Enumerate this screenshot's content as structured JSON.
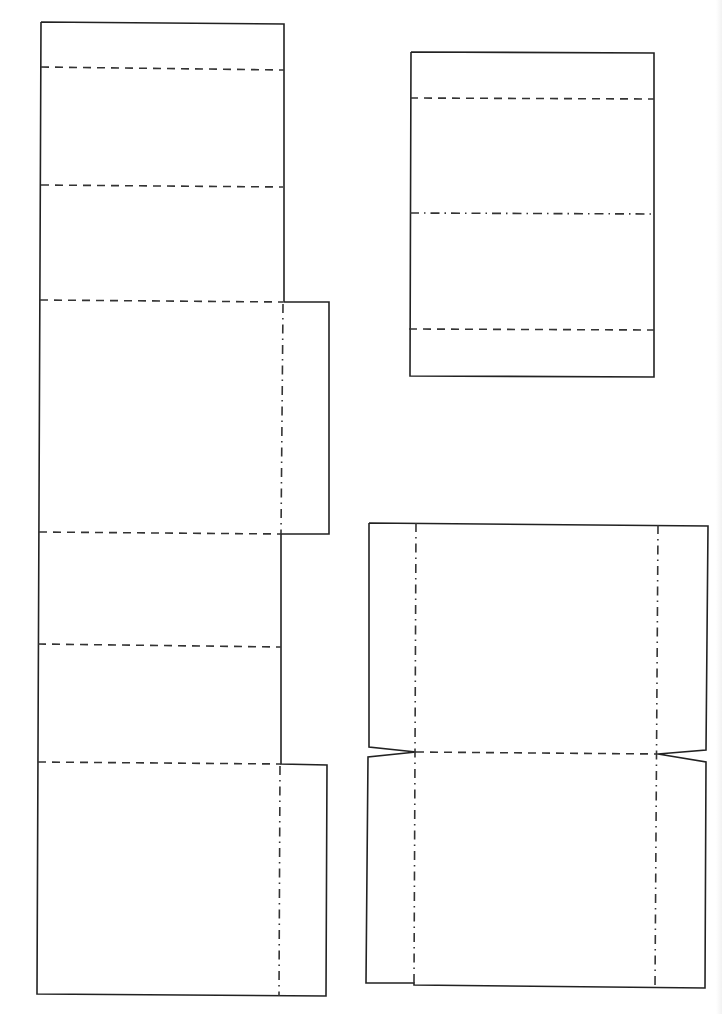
{
  "page": {
    "width": 722,
    "height": 1014,
    "background": "#ffffff",
    "line_color": "#222222"
  },
  "legend": {
    "cut_line": "solid",
    "valley_fold": "dashed",
    "mountain_fold": "dash-dot"
  },
  "pieces": [
    {
      "name": "long-strip",
      "cut_outline": [
        [
          41,
          22
        ],
        [
          284,
          24
        ],
        [
          284,
          302
        ],
        [
          329,
          302
        ],
        [
          329,
          534
        ],
        [
          281,
          534
        ],
        [
          281,
          764
        ],
        [
          327,
          765
        ],
        [
          326,
          996
        ],
        [
          37,
          994
        ],
        [
          41,
          22
        ]
      ],
      "folds": [
        {
          "type": "dashed",
          "from": [
            41,
            67
          ],
          "to": [
            284,
            70
          ]
        },
        {
          "type": "dashed",
          "from": [
            41,
            185
          ],
          "to": [
            283,
            187
          ]
        },
        {
          "type": "dashed",
          "from": [
            40,
            300
          ],
          "to": [
            283,
            302
          ]
        },
        {
          "type": "dashdot",
          "from": [
            283,
            304
          ],
          "to": [
            281,
            534
          ]
        },
        {
          "type": "dashed",
          "from": [
            39,
            532
          ],
          "to": [
            281,
            534
          ]
        },
        {
          "type": "dashed",
          "from": [
            38,
            644
          ],
          "to": [
            281,
            647
          ]
        },
        {
          "type": "dashed",
          "from": [
            38,
            762
          ],
          "to": [
            281,
            764
          ]
        },
        {
          "type": "dashdot",
          "from": [
            280,
            766
          ],
          "to": [
            279,
            996
          ]
        }
      ]
    },
    {
      "name": "small-panel",
      "cut_outline": [
        [
          411,
          52
        ],
        [
          654,
          53
        ],
        [
          654,
          377
        ],
        [
          410,
          376
        ],
        [
          411,
          52
        ]
      ],
      "folds": [
        {
          "type": "dashed",
          "from": [
            410,
            98
          ],
          "to": [
            654,
            99
          ]
        },
        {
          "type": "dashdot",
          "from": [
            410,
            213
          ],
          "to": [
            654,
            214
          ]
        },
        {
          "type": "dashed",
          "from": [
            409,
            329
          ],
          "to": [
            654,
            330
          ]
        }
      ]
    },
    {
      "name": "tray-net",
      "cut_outline": [
        [
          369,
          523
        ],
        [
          708,
          526
        ],
        [
          706,
          750
        ],
        [
          658,
          754
        ],
        [
          706,
          762
        ],
        [
          705,
          988
        ],
        [
          414,
          985
        ],
        [
          414,
          983
        ],
        [
          366,
          983
        ],
        [
          368,
          757
        ],
        [
          416,
          752
        ],
        [
          369,
          747
        ],
        [
          369,
          523
        ]
      ],
      "folds": [
        {
          "type": "dashdot",
          "from": [
            416,
            523
          ],
          "to": [
            414,
            983
          ]
        },
        {
          "type": "dashdot",
          "from": [
            658,
            525
          ],
          "to": [
            655,
            988
          ]
        },
        {
          "type": "dashed",
          "from": [
            416,
            752
          ],
          "to": [
            658,
            754
          ]
        }
      ]
    }
  ]
}
